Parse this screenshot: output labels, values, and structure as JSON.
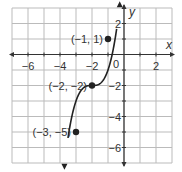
{
  "chart_data": {
    "type": "line",
    "title": "",
    "xlabel": "x",
    "ylabel": "y",
    "xlim": [
      -7,
      3
    ],
    "ylim": [
      -7,
      3
    ],
    "grid": true,
    "x_ticks": [
      "-6",
      "-4",
      "-2",
      "2"
    ],
    "y_ticks": [
      "2",
      "-2",
      "-4",
      "-6"
    ],
    "origin_label": "0",
    "series": [
      {
        "name": "cubic curve",
        "description": "y = (x + 2)^3 - 2",
        "x": [
          -3.3,
          -3,
          -2.5,
          -2,
          -1.5,
          -1,
          -0.8
        ],
        "y": [
          -4.2,
          -5,
          -2.125,
          -2,
          -1.875,
          1,
          3.5
        ]
      }
    ],
    "points": [
      {
        "x": -1,
        "y": 1,
        "label": "(−1, 1)"
      },
      {
        "x": -2,
        "y": -2,
        "label": "(−2, −2)"
      },
      {
        "x": -3,
        "y": -5,
        "label": "(−3, −5)"
      }
    ]
  }
}
